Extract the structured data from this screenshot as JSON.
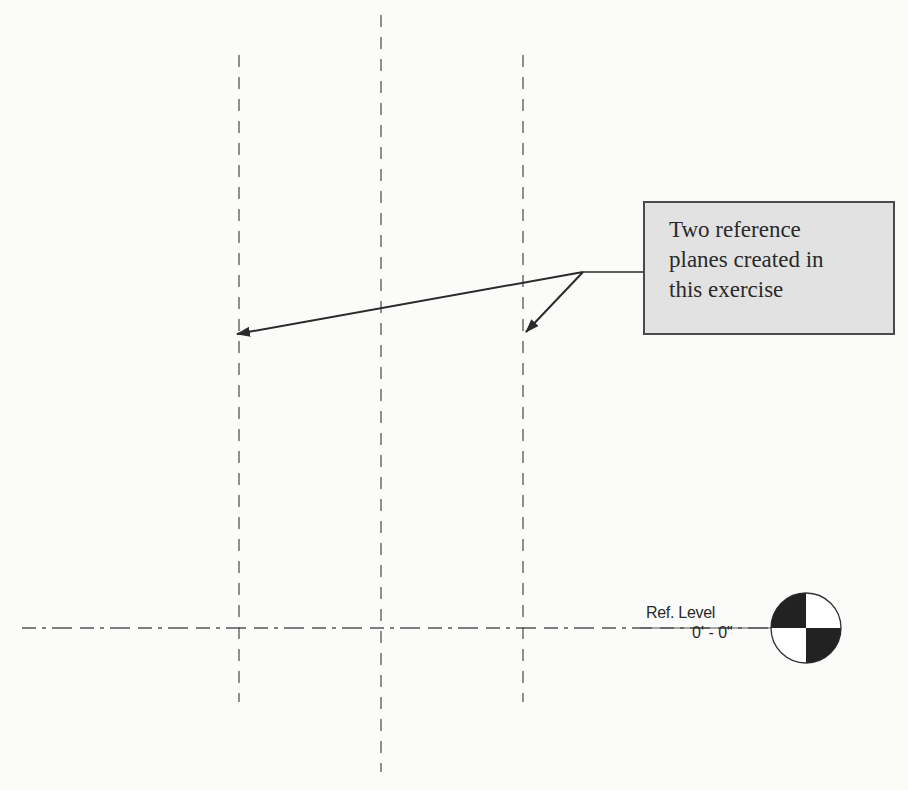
{
  "diagram": {
    "reference_planes": [
      {
        "name": "left",
        "x": 239,
        "y_start": 55,
        "y_end": 702
      },
      {
        "name": "center",
        "x": 381,
        "y_start": 15,
        "y_end": 772
      },
      {
        "name": "right",
        "x": 523,
        "y_start": 55,
        "y_end": 702
      }
    ],
    "level_line": {
      "y": 628,
      "x_start": 22,
      "x_end": 775
    },
    "callout": {
      "lines": [
        "Two reference",
        "planes created in",
        "this exercise"
      ],
      "fill": "#e2e2e2",
      "border": "#4a4a4a"
    },
    "leaders": {
      "origin": [
        583,
        272
      ],
      "targets": [
        [
          236,
          334
        ],
        [
          525,
          333
        ]
      ]
    },
    "level": {
      "name": "Ref. Level",
      "elevation": "0' - 0\""
    }
  }
}
